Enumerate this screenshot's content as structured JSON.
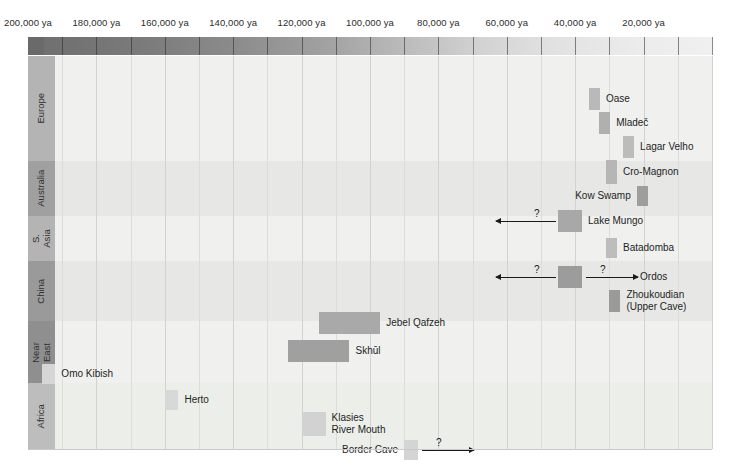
{
  "chart_data": {
    "type": "table",
    "xlabel": "years ago (ya)",
    "axis": {
      "x_left_value": 200000,
      "x_right_value": 0,
      "x_unit": "ya",
      "direction": "decreasing-left-to-right",
      "top_ticks": [
        "200,000 ya",
        "180,000 ya",
        "160,000 ya",
        "140,000 ya",
        "120,000 ya",
        "100,000 ya",
        "80,000 ya",
        "60,000 ya",
        "40,000 ya",
        "20,000 ya"
      ],
      "top_tick_values": [
        200000,
        180000,
        160000,
        140000,
        120000,
        100000,
        80000,
        60000,
        40000,
        20000
      ],
      "bottom_ticks": [
        "190,000 ya",
        "170,000 ya",
        "150,000 ya",
        "130,000 ya",
        "110,000 ya",
        "90,000 ya",
        "70,000 ya",
        "50,000 ya",
        "30,000 ya",
        "10,000 ya"
      ],
      "bottom_tick_values": [
        190000,
        170000,
        150000,
        130000,
        110000,
        90000,
        70000,
        50000,
        30000,
        10000
      ],
      "gridlines": true,
      "gradient_bar": {
        "description": "time-depth shading strip, dark at 200,000 ya fading to light at present",
        "from_color": "#6a6a6a",
        "to_color": "#f0f0f0"
      }
    },
    "regions": [
      {
        "label": "Europe",
        "strip_color": "#b4b4b4"
      },
      {
        "label": "Australia",
        "strip_color": "#a0a0a0"
      },
      {
        "label": "S.\nAsia",
        "strip_color": "#b4b4b4"
      },
      {
        "label": "China",
        "strip_color": "#9a9a9a"
      },
      {
        "label": "Near\nEast",
        "strip_color": "#8f8f8f"
      },
      {
        "label": "Africa",
        "strip_color": "#bdbdbd"
      }
    ],
    "sites": [
      {
        "name": "Oase",
        "region": "Europe",
        "from": 36000,
        "to": 34000,
        "color": "#b9b9b9",
        "label_side": "right",
        "arrow": "none"
      },
      {
        "name": "Mladeč",
        "region": "Europe",
        "from": 33000,
        "to": 31000,
        "color": "#b0b0b0",
        "label_side": "right",
        "arrow": "none"
      },
      {
        "name": "Lagar Velho",
        "region": "Europe",
        "from": 26000,
        "to": 24000,
        "color": "#bcbcbc",
        "label_side": "right",
        "arrow": "none"
      },
      {
        "name": "Cro-Magnon",
        "region": "Europe",
        "from": 31000,
        "to": 29000,
        "color": "#b6b6b6",
        "label_side": "right",
        "arrow": "none"
      },
      {
        "name": "Kow Swamp",
        "region": "Australia",
        "from": 22000,
        "to": 19000,
        "color": "#9e9e9e",
        "label_side": "left",
        "arrow": "none"
      },
      {
        "name": "Lake Mungo",
        "region": "Australia",
        "from": 45000,
        "to": 38000,
        "color": "#a8a8a8",
        "label_side": "right",
        "arrow": "left",
        "arrow_qmark": "?"
      },
      {
        "name": "Batadomba",
        "region": "S. Asia",
        "from": 31000,
        "to": 28000,
        "color": "#bdbdbd",
        "label_side": "right",
        "arrow": "none"
      },
      {
        "name": "Ordos",
        "region": "China",
        "from": 45000,
        "to": 38000,
        "color": "#9c9c9c",
        "label_side": "right",
        "arrow": "both",
        "arrow_qmark": "?"
      },
      {
        "name": "Zhoukoudian\n(Upper Cave)",
        "region": "China",
        "from": 30000,
        "to": 27000,
        "color": "#9a9a9a",
        "label_side": "right",
        "arrow": "none"
      },
      {
        "name": "Jebel Qafzeh",
        "region": "Near East",
        "from": 115000,
        "to": 97000,
        "color": "#a9a9a9",
        "label_side": "right",
        "arrow": "none"
      },
      {
        "name": "Skhūl",
        "region": "Near East",
        "from": 124000,
        "to": 106000,
        "color": "#a0a0a0",
        "label_side": "right",
        "arrow": "none"
      },
      {
        "name": "Omo Kibish",
        "region": "Africa",
        "from": 196000,
        "to": 192000,
        "color": "#d6d6d6",
        "label_side": "right",
        "arrow": "none"
      },
      {
        "name": "Klasies\nRiver Mouth",
        "region": "Africa",
        "from": 120000,
        "to": 113000,
        "color": "#d2d2d2",
        "label_side": "right",
        "arrow": "none"
      },
      {
        "name": "Herto",
        "region": "Africa",
        "from": 160000,
        "to": 156000,
        "color": "#d8d8d8",
        "label_side": "right",
        "arrow": "none"
      },
      {
        "name": "Border Cave",
        "region": "Africa",
        "from": 90000,
        "to": 86000,
        "color": "#d4d4d4",
        "label_side": "left",
        "arrow": "right",
        "arrow_qmark": "?"
      }
    ]
  }
}
